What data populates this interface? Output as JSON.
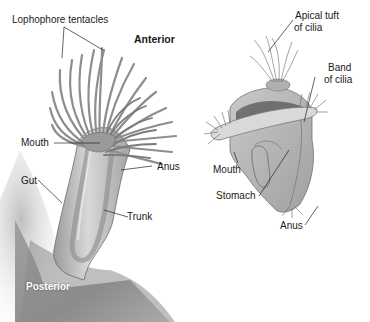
{
  "figure": {
    "left_panel": {
      "subject": "adult lophophorate (phoronid-like) with lophophore",
      "labels": {
        "lophophore_tentacles": "Lophophore tentacles",
        "anterior": "Anterior",
        "mouth": "Mouth",
        "anus": "Anus",
        "gut": "Gut",
        "trunk": "Trunk",
        "posterior": "Posterior"
      }
    },
    "right_panel": {
      "subject": "trochophore-type larva",
      "labels": {
        "apical_tuft": "Apical tuft",
        "apical_tuft_2": "of cilia",
        "band": "Band",
        "band_2": "of cilia",
        "mouth": "Mouth",
        "stomach": "Stomach",
        "anus": "Anus"
      }
    },
    "colors": {
      "background": "#ffffff",
      "tissue_light": "#d4d4d4",
      "tissue_mid": "#a8a8a8",
      "tissue_dark": "#6e6e6e",
      "substrate": "#8a8a8a",
      "label_text": "#1a1a1a"
    }
  }
}
